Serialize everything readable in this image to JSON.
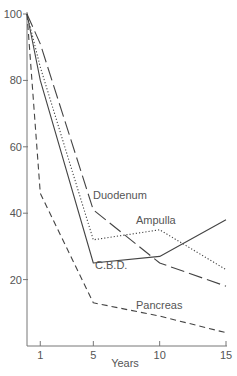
{
  "chart_data": {
    "type": "line",
    "title": "",
    "xlabel": "Years",
    "ylabel": "",
    "xlim": [
      0,
      15
    ],
    "ylim": [
      0,
      100
    ],
    "x_ticks": [
      1,
      5,
      10,
      15
    ],
    "y_ticks": [
      20,
      40,
      60,
      80,
      100
    ],
    "grid": false,
    "legend": "inline labels",
    "x": [
      0,
      1,
      5,
      10,
      15
    ],
    "series": [
      {
        "name": "Duodenum",
        "style": "long-dash",
        "x": [
          0,
          1,
          5,
          10,
          15
        ],
        "values": [
          100,
          91,
          41,
          25,
          18
        ],
        "label_pos": [
          93,
          199
        ]
      },
      {
        "name": "Ampulla",
        "style": "dotted",
        "x": [
          0,
          1,
          5,
          10,
          15
        ],
        "values": [
          100,
          84,
          32,
          35,
          23
        ],
        "label_pos": [
          136,
          224
        ]
      },
      {
        "name": "C.B.D.",
        "style": "solid",
        "x": [
          0,
          1,
          5,
          10,
          15
        ],
        "values": [
          100,
          80,
          25,
          27,
          38
        ],
        "label_pos": [
          95,
          269
        ]
      },
      {
        "name": "Pancreas",
        "style": "short-dash",
        "x": [
          0,
          1,
          5,
          10,
          15
        ],
        "values": [
          100,
          46,
          13,
          9,
          4
        ],
        "label_pos": [
          136,
          309
        ]
      }
    ]
  },
  "axis": {
    "color": "#777777",
    "line_color": "#444444"
  }
}
